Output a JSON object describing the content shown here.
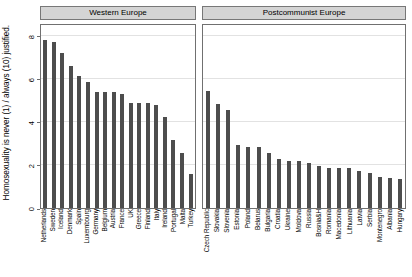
{
  "chart_data": {
    "type": "bar",
    "title": "",
    "xlabel": "",
    "ylabel": "Homosexuality is never (1) / always (10) justified.",
    "ylim": [
      0,
      8.6
    ],
    "yticks": [
      0,
      2,
      4,
      6,
      8
    ],
    "ytick_labels": [
      "0",
      "2",
      "4",
      "6",
      "8"
    ],
    "grid": "horizontal",
    "legend": "none",
    "bar_color": "#4d4d4d",
    "strip_color": "#d4d4d4",
    "panels": [
      {
        "label": "Western Europe",
        "categories": [
          "Netherlands",
          "Sweden",
          "Iceland",
          "Denmark",
          "Spain",
          "Luxembourg",
          "Germany",
          "Belgium",
          "Austria",
          "France",
          "UK",
          "Greece",
          "Finland",
          "Italy",
          "Ireland",
          "Portugal",
          "Malta",
          "Turkey"
        ],
        "values": [
          7.8,
          7.7,
          7.2,
          6.6,
          6.15,
          5.85,
          5.4,
          5.4,
          5.4,
          5.3,
          4.9,
          4.9,
          4.9,
          4.8,
          4.25,
          3.15,
          2.55,
          1.6
        ]
      },
      {
        "label": "Postcommunist Europe",
        "categories": [
          "Czech Republic",
          "Slovakia",
          "Slovenia",
          "Estonia",
          "Poland",
          "Belarus",
          "Bulgaria",
          "Croatia",
          "Ukraine",
          "Moldova",
          "Russia",
          "Bosnia&H",
          "Romania",
          "Macedonia",
          "Lithuania",
          "Latvia",
          "Serbia",
          "Montenegro",
          "Albania",
          "Hungary"
        ],
        "values": [
          5.45,
          4.85,
          4.55,
          2.95,
          2.85,
          2.85,
          2.55,
          2.3,
          2.2,
          2.2,
          2.1,
          1.95,
          1.85,
          1.85,
          1.85,
          1.7,
          1.65,
          1.45,
          1.4,
          1.35
        ]
      }
    ]
  }
}
